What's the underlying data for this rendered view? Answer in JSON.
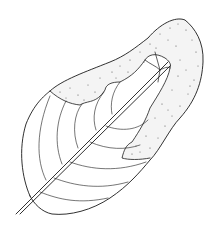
{
  "figure": {
    "colors": {
      "background": "#ffffff",
      "ink": "#1a1a1a",
      "stipple": "#555555"
    }
  }
}
